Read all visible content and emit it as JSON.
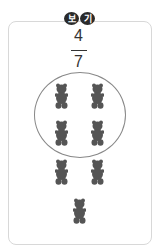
{
  "badge": {
    "chars": [
      "보",
      "기"
    ]
  },
  "fraction": {
    "numerator": "4",
    "denominator": "7"
  },
  "bears": [
    {
      "x": 55,
      "y": 83
    },
    {
      "x": 91,
      "y": 83
    },
    {
      "x": 55,
      "y": 120
    },
    {
      "x": 91,
      "y": 120
    },
    {
      "x": 55,
      "y": 159
    },
    {
      "x": 91,
      "y": 159
    },
    {
      "x": 73,
      "y": 198
    }
  ],
  "colors": {
    "bear": "#555555",
    "circle": "#888888"
  }
}
